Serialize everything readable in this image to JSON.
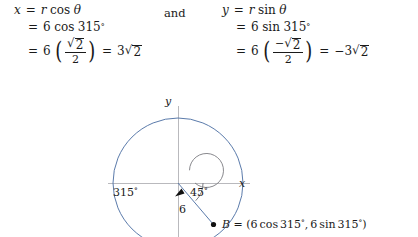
{
  "connector": {
    "and_label": "and"
  },
  "equations": {
    "left": {
      "lhs_var": "x",
      "line1": {
        "eq": "=",
        "rhs_r": "r",
        "rhs_fn": "cos",
        "rhs_theta": "θ"
      },
      "line2": {
        "eq": "=",
        "coef": "6",
        "fn": "cos",
        "angle": "315",
        "degree": "°"
      },
      "line3": {
        "eq": "=",
        "coef": "6",
        "paren_open": "(",
        "paren_close": ")",
        "num_sign": "",
        "num_radicand": "2",
        "radical": "√",
        "den": "2",
        "eq2": "=",
        "result_coef": "3",
        "result_radicand": "2"
      }
    },
    "right": {
      "lhs_var": "y",
      "line1": {
        "eq": "=",
        "rhs_r": "r",
        "rhs_fn": "sin",
        "rhs_theta": "θ"
      },
      "line2": {
        "eq": "=",
        "coef": "6",
        "fn": "sin",
        "angle": "315",
        "degree": "°"
      },
      "line3": {
        "eq": "=",
        "coef": "6",
        "paren_open": "(",
        "paren_close": ")",
        "num_sign": "−",
        "num_radicand": "2",
        "radical": "√",
        "den": "2",
        "eq2": "=",
        "result_sign": "−",
        "result_coef": "3",
        "result_radicand": "2"
      }
    }
  },
  "figure": {
    "axis_labels": {
      "x": "x",
      "y": "y"
    },
    "angle_large": "315",
    "angle_large_degree": "°",
    "angle_small": "45",
    "angle_small_degree": "°",
    "radius_label": "6",
    "point": {
      "name": "B",
      "equals": "=",
      "open": "(",
      "coef_x": "6",
      "fn_x": "cos",
      "angle_x": "315",
      "degree": "°",
      "comma": ",",
      "coef_y": "6",
      "fn_y": "sin",
      "angle_y": "315",
      "close": ")"
    },
    "geometry": {
      "origin_x": 178,
      "origin_y": 91,
      "circle_radius": 65,
      "terminal_angle_deg": 315,
      "sweep_arc_radius": 17
    },
    "colors": {
      "circle": "#5b7bab",
      "ray": "#5b7bab",
      "axis": "#b9b9bd",
      "arc": "#7a7a80",
      "text": "#1a1a1a"
    }
  }
}
